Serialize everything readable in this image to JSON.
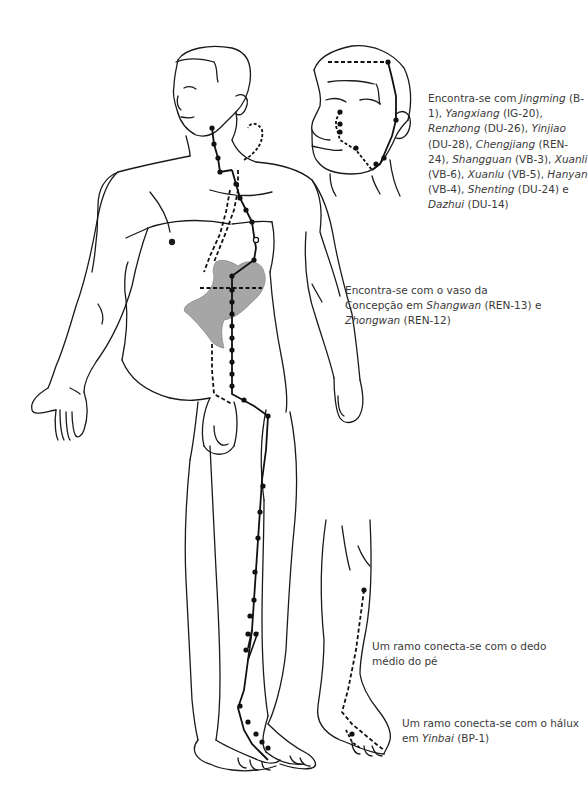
{
  "diagram": {
    "type": "acupuncture-meridian-illustration",
    "annotations": {
      "face": {
        "segments": [
          {
            "text": "Encontra-se com ",
            "italic": false
          },
          {
            "text": "Jingming",
            "italic": true
          },
          {
            "text": " (B-1), ",
            "italic": false
          },
          {
            "text": "Yangxiang",
            "italic": true
          },
          {
            "text": " (IG-20), ",
            "italic": false
          },
          {
            "text": "Renzhong",
            "italic": true
          },
          {
            "text": " (DU-26), ",
            "italic": false
          },
          {
            "text": "Yinjiao",
            "italic": true
          },
          {
            "text": " (DU-28), ",
            "italic": false
          },
          {
            "text": "Chengjiang",
            "italic": true
          },
          {
            "text": " (REN-24), ",
            "italic": false
          },
          {
            "text": "Shangguan",
            "italic": true
          },
          {
            "text": " (VB-3), ",
            "italic": false
          },
          {
            "text": "Xuanli",
            "italic": true
          },
          {
            "text": " (VB-6), ",
            "italic": false
          },
          {
            "text": "Xuanlu",
            "italic": true
          },
          {
            "text": " (VB-5), ",
            "italic": false
          },
          {
            "text": "Hanyan",
            "italic": true
          },
          {
            "text": " (VB-4), ",
            "italic": false
          },
          {
            "text": "Shenting",
            "italic": true
          },
          {
            "text": " (DU-24) e ",
            "italic": false
          },
          {
            "text": "Dazhui",
            "italic": true
          },
          {
            "text": " (DU-14)",
            "italic": false
          }
        ]
      },
      "stomach": {
        "segments": [
          {
            "text": "Encontra-se com o vaso da Concepção em ",
            "italic": false
          },
          {
            "text": "Shangwan",
            "italic": true
          },
          {
            "text": " (REN-13) e ",
            "italic": false
          },
          {
            "text": "Zhongwan",
            "italic": true
          },
          {
            "text": " (REN-12)",
            "italic": false
          }
        ]
      },
      "middle_toe": {
        "segments": [
          {
            "text": "Um ramo conecta-se com o dedo médio do pé",
            "italic": false
          }
        ]
      },
      "hallux": {
        "segments": [
          {
            "text": "Um ramo conecta-se com o hálux em ",
            "italic": false
          },
          {
            "text": "Yinbai",
            "italic": true
          },
          {
            "text": " (BP-1)",
            "italic": false
          }
        ]
      }
    },
    "colors": {
      "outline": "#1a1a1a",
      "stomach_fill": "#a6a6a6",
      "text": "#3a3a3a",
      "background": "#ffffff"
    }
  }
}
